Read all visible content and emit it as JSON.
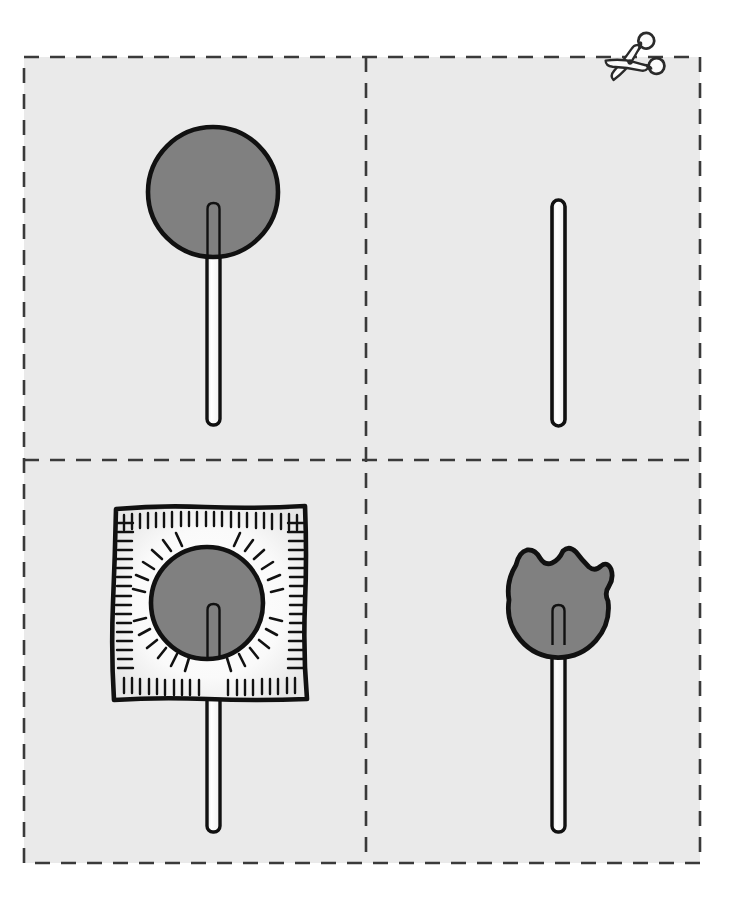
{
  "worksheet": {
    "title": "Lollipop Cut-Out Worksheet",
    "background_color": "#ffffff",
    "sheet_color": "#eaeaea",
    "border": {
      "style": "dashed",
      "color": "#3a3a3a",
      "x": 24,
      "y": 57,
      "width": 676,
      "height": 806
    },
    "dividers": {
      "vertical_x": 366,
      "horizontal_y": 460,
      "style": "dashed",
      "color": "#3a3a3a"
    },
    "cut_icon": {
      "name": "scissors-icon",
      "x": 630,
      "y": 62,
      "label": "Cut along the dashed lines"
    },
    "colors": {
      "candy_fill": "#808080",
      "outline": "#111111",
      "stick_fill": "#fbfbfb",
      "wrapper_fill": "#f5f5f5",
      "sheet": "#eaeaea",
      "page": "#ffffff"
    },
    "panels": [
      {
        "id": "panel-top-left",
        "name": "whole-lollipop",
        "label": "Whole lollipop",
        "row": 1,
        "column": 1,
        "candy": {
          "shape": "circle",
          "center_x": 213,
          "center_y": 192,
          "radius": 65,
          "fill": "#808080"
        },
        "stick": {
          "x": 207,
          "top": 203,
          "bottom": 425,
          "width": 13,
          "fill": "#fbfbfb"
        }
      },
      {
        "id": "panel-top-right",
        "name": "bare-stick",
        "label": "Bare stick",
        "row": 1,
        "column": 2,
        "candy": null,
        "stick": {
          "x": 552,
          "top": 200,
          "bottom": 426,
          "width": 13,
          "fill": "#fbfbfb"
        }
      },
      {
        "id": "panel-bottom-left",
        "name": "wrapped-lollipop",
        "label": "Wrapped lollipop",
        "row": 2,
        "column": 1,
        "wrapper": {
          "shape": "square",
          "x": 113,
          "y": 505,
          "width": 195,
          "height": 195,
          "fill": "#f5f5f5",
          "edge_ticks": 68,
          "radiating_dashes": 24
        },
        "candy": {
          "shape": "circle",
          "center_x": 207,
          "center_y": 603,
          "radius": 56,
          "fill": "#808080"
        },
        "stick": {
          "x": 207,
          "top": 604,
          "bottom": 832,
          "width": 13,
          "fill": "#fbfbfb"
        }
      },
      {
        "id": "panel-bottom-right",
        "name": "bitten-lollipop",
        "label": "Bitten lollipop",
        "row": 2,
        "column": 2,
        "candy": {
          "shape": "circle-with-bite",
          "center_x": 558,
          "center_y": 595,
          "radius": 52,
          "fill": "#808080",
          "bite_count": 3,
          "bite_side": "top-right"
        },
        "stick": {
          "x": 552,
          "top": 605,
          "bottom": 832,
          "width": 13,
          "fill": "#fbfbfb"
        }
      }
    ]
  }
}
